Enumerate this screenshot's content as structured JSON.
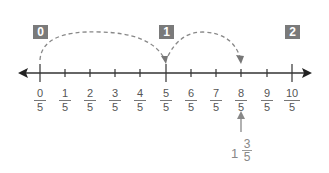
{
  "diagram": {
    "type": "number-line",
    "whole_markers": [
      {
        "label": "0",
        "x": 33
      },
      {
        "label": "1",
        "x": 159
      },
      {
        "label": "2",
        "x": 285
      }
    ],
    "ticks": [
      {
        "num": "0",
        "den": "5"
      },
      {
        "num": "1",
        "den": "5"
      },
      {
        "num": "2",
        "den": "5"
      },
      {
        "num": "3",
        "den": "5"
      },
      {
        "num": "4",
        "den": "5"
      },
      {
        "num": "5",
        "den": "5"
      },
      {
        "num": "6",
        "den": "5"
      },
      {
        "num": "7",
        "den": "5"
      },
      {
        "num": "8",
        "den": "5"
      },
      {
        "num": "9",
        "den": "5"
      },
      {
        "num": "10",
        "den": "5"
      }
    ],
    "jumps": [
      {
        "from": "0/5",
        "to": "5/5"
      },
      {
        "from": "5/5",
        "to": "8/5"
      }
    ],
    "pointer": {
      "target": "8/5",
      "mixed_number": {
        "whole": "1",
        "num": "3",
        "den": "5"
      }
    },
    "colors": {
      "marker_box": "#7a7a7a",
      "line": "#333333",
      "dashed_arc": "#888888",
      "label_text": "#555555",
      "mixed_text": "#888888"
    }
  }
}
